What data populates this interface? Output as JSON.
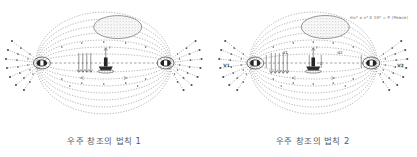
{
  "document": {
    "background_color": "#ffffff",
    "ink_color": "#4a4a4c",
    "figure_count": 2
  },
  "figures": [
    {
      "id": "figure-1",
      "caption": "우주 창조의 법칙 1",
      "formula": "",
      "labels": {
        "left_pole": "",
        "right_pole": "",
        "distance_left": "",
        "distance_right": "",
        "center": "",
        "force": "F"
      },
      "elements": {
        "cloud_blob": "stippled-oval-cloud",
        "left_node": "dark-ellipse-node",
        "right_node": "dark-ellipse-node",
        "center_object": "anvil-with-post",
        "field_lines": "dotted-dipole-loops",
        "rays": "radiating-dotted-rays",
        "axis": "dashed-horizontal-axis"
      }
    },
    {
      "id": "figure-2",
      "caption": "우주 창조의 법칙 2",
      "formula": "mc² x v² X 10² = P (Peace)",
      "labels": {
        "left_pole": "V1",
        "right_pole": "V2",
        "distance_left": "d1",
        "distance_right": "d2",
        "center": "C",
        "force": "F"
      },
      "elements": {
        "cloud_blob": "stippled-oval-cloud",
        "left_node": "dark-ellipse-node",
        "right_node": "dark-ellipse-node",
        "center_object": "anvil-with-post",
        "field_lines": "dotted-dipole-loops",
        "rays": "radiating-dotted-rays",
        "axis": "dashed-horizontal-axis"
      }
    }
  ]
}
